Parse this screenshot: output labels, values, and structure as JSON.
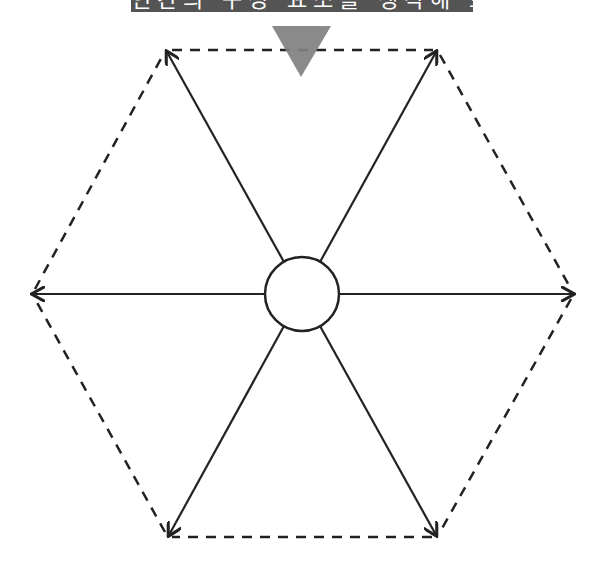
{
  "banner": {
    "text": "인간의 구성 요소를 생각해 보세요",
    "background": "#545454",
    "text_color": "#ffffff",
    "note": ""
  },
  "pointer": {
    "color": "#808080"
  },
  "diagram": {
    "type": "hexagon-spoke",
    "stroke_color": "#222222",
    "center": {
      "x": 302,
      "y": 294,
      "radius": 37
    },
    "vertices": [
      {
        "x": 166,
        "y": 50
      },
      {
        "x": 437,
        "y": 50
      },
      {
        "x": 574,
        "y": 294
      },
      {
        "x": 437,
        "y": 537
      },
      {
        "x": 168,
        "y": 537
      },
      {
        "x": 32,
        "y": 294
      }
    ],
    "segment_labels": [
      "",
      "",
      "",
      "",
      "",
      ""
    ]
  }
}
